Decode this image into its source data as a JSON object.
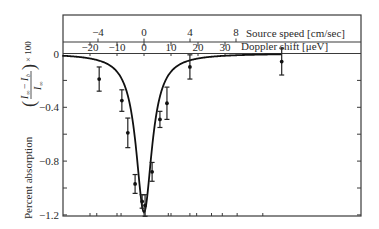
{
  "chart_data": {
    "type": "scatter",
    "title": "",
    "xlabel": "Doppler shift [μeV]",
    "x2label": "Source speed [cm/sec]",
    "ylabel_text": "Percent absorption",
    "ylabel_formula": {
      "num_a": "I",
      "num_a_sub": "∞",
      "minus": "−",
      "num_b": "I",
      "num_b_sub": "b",
      "den": "I",
      "den_sub": "∞",
      "times": "× 100"
    },
    "xlim": [
      -34,
      80
    ],
    "ylim": [
      -1.2,
      0.0
    ],
    "x_ticks": [
      -20,
      -10,
      0,
      10,
      20,
      30
    ],
    "x_tick_labels": [
      "−20",
      "−10",
      "0",
      "10",
      "20",
      "30"
    ],
    "x2_ticks": [
      -4,
      0,
      4,
      8
    ],
    "x2_tick_labels": [
      "−4",
      "0",
      "4",
      "8"
    ],
    "y_ticks": [
      0,
      -0.4,
      -0.8,
      -1.2
    ],
    "y_tick_labels": [
      "0",
      "−0.4",
      "−0.8",
      "−1.2"
    ],
    "y_minor_ticks": [
      -0.2,
      -0.6,
      -1.0
    ],
    "grid": false,
    "series": [
      {
        "name": "measured",
        "kind": "points_with_errorbars",
        "points": [
          {
            "x": -16.6,
            "y": -0.19,
            "err": 0.09
          },
          {
            "x": -8.2,
            "y": -0.35,
            "err": 0.08
          },
          {
            "x": -6.0,
            "y": -0.59,
            "err": 0.11
          },
          {
            "x": -3.3,
            "y": -0.97,
            "err": 0.07
          },
          {
            "x": -0.7,
            "y": -1.1,
            "err": 0.05
          },
          {
            "x": 0.4,
            "y": -1.13,
            "err": 0.08
          },
          {
            "x": 3.0,
            "y": -0.88,
            "err": 0.07
          },
          {
            "x": 5.9,
            "y": -0.49,
            "err": 0.06
          },
          {
            "x": 8.5,
            "y": -0.37,
            "err": 0.12
          },
          {
            "x": 17.0,
            "y": -0.1,
            "err": 0.09
          },
          {
            "x": 51.0,
            "y": -0.06,
            "err": 0.1
          }
        ]
      },
      {
        "name": "fit",
        "kind": "lorentzian_curve",
        "center": 0.0,
        "depth": 1.18,
        "hwhm": 3.6,
        "baseline": 0.0,
        "x_range": [
          -34,
          51
        ]
      }
    ],
    "bottom_minor_ticks": [
      -20,
      -17.5,
      -10,
      -8.5,
      0,
      9,
      10,
      17,
      19.5,
      25,
      29,
      34.5,
      44
    ]
  }
}
